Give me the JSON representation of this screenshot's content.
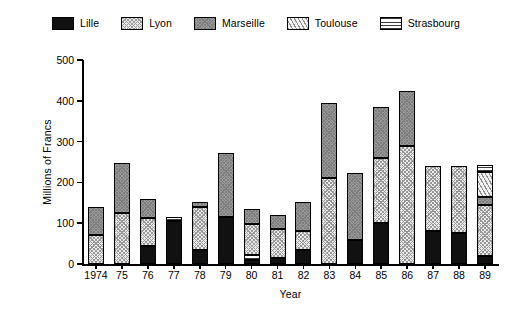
{
  "legend": {
    "entries": [
      {
        "label": "Lille",
        "key": "lille",
        "pattern": "solid-black",
        "color": "#111111"
      },
      {
        "label": "Lyon",
        "key": "lyon",
        "pattern": "fine-crosshatch",
        "color": "#e9e9e9"
      },
      {
        "label": "Marseille",
        "key": "marseille",
        "pattern": "gray-fill",
        "color": "#9b9b9b"
      },
      {
        "label": "Toulouse",
        "key": "toulouse",
        "pattern": "diagonal-hatch",
        "color": "#f2f2f2"
      },
      {
        "label": "Strasbourg",
        "key": "strasbourg",
        "pattern": "horizontal-lines",
        "color": "#ffffff"
      }
    ]
  },
  "axes": {
    "y_title": "Millions of Francs",
    "x_title": "Year",
    "y_ticks": [
      0,
      100,
      200,
      300,
      400,
      500
    ],
    "y_tick_labels": [
      "0",
      "100",
      "200",
      "300",
      "400",
      "500"
    ],
    "x_tick_labels": [
      "1974",
      "75",
      "76",
      "77",
      "78",
      "79",
      "80",
      "81",
      "82",
      "83",
      "84",
      "85",
      "86",
      "87",
      "88",
      "89"
    ]
  },
  "chart_data": {
    "type": "bar",
    "title": "",
    "subtitle": "",
    "xlabel": "Year",
    "ylabel": "Millions of Francs",
    "ylim": [
      0,
      500
    ],
    "grid": false,
    "stacked": true,
    "legend_position": "top",
    "categories": [
      "1974",
      "75",
      "76",
      "77",
      "78",
      "79",
      "80",
      "81",
      "82",
      "83",
      "84",
      "85",
      "86",
      "87",
      "88",
      "89"
    ],
    "series": [
      {
        "name": "Lille",
        "values": [
          0,
          0,
          45,
          105,
          35,
          115,
          10,
          15,
          35,
          0,
          60,
          100,
          0,
          80,
          75,
          20
        ]
      },
      {
        "name": "Lyon",
        "values": [
          72,
          125,
          68,
          0,
          105,
          0,
          75,
          70,
          45,
          210,
          0,
          160,
          290,
          160,
          165,
          125
        ]
      },
      {
        "name": "Marseille",
        "values": [
          68,
          122,
          47,
          0,
          13,
          158,
          38,
          35,
          72,
          185,
          163,
          125,
          135,
          0,
          0,
          20
        ]
      },
      {
        "name": "Toulouse",
        "values": [
          0,
          0,
          0,
          0,
          0,
          0,
          0,
          0,
          0,
          0,
          0,
          0,
          0,
          0,
          0,
          60
        ]
      },
      {
        "name": "Strasbourg",
        "values": [
          0,
          0,
          0,
          10,
          0,
          0,
          12,
          0,
          0,
          0,
          0,
          0,
          0,
          0,
          0,
          18
        ]
      }
    ],
    "totals": [
      140,
      247,
      160,
      115,
      153,
      273,
      135,
      120,
      152,
      395,
      223,
      385,
      425,
      240,
      240,
      243
    ],
    "stack_order": [
      [
        "lyon",
        "marseille"
      ],
      [
        "lyon",
        "marseille"
      ],
      [
        "lille",
        "lyon",
        "marseille"
      ],
      [
        "lille",
        "strasbourg"
      ],
      [
        "lille",
        "lyon",
        "marseille"
      ],
      [
        "lille",
        "marseille"
      ],
      [
        "lille",
        "strasbourg",
        "lyon",
        "marseille"
      ],
      [
        "lille",
        "lyon",
        "marseille"
      ],
      [
        "lille",
        "lyon",
        "marseille"
      ],
      [
        "lyon",
        "marseille"
      ],
      [
        "lille",
        "marseille"
      ],
      [
        "lille",
        "lyon",
        "marseille"
      ],
      [
        "lyon",
        "marseille"
      ],
      [
        "lille",
        "lyon"
      ],
      [
        "lille",
        "lyon"
      ],
      [
        "lille",
        "lyon",
        "marseille",
        "toulouse",
        "strasbourg"
      ]
    ]
  }
}
